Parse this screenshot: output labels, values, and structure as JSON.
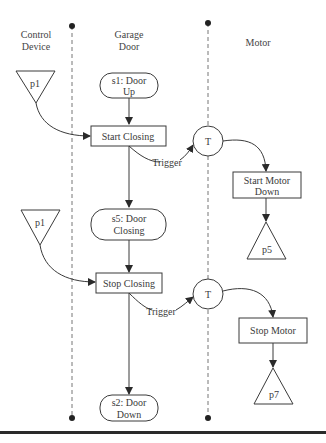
{
  "lanes": {
    "control_device": {
      "line1": "Control",
      "line2": "Device"
    },
    "garage_door": {
      "line1": "Garage",
      "line2": "Door"
    },
    "motor": {
      "label": "Motor"
    }
  },
  "places": {
    "p1_top": "p1",
    "p1_bottom": "p1",
    "p5": "p5",
    "p7": "p7"
  },
  "states": {
    "s1": {
      "line1": "s1: Door",
      "line2": "Up"
    },
    "s5": {
      "line1": "s5: Door",
      "line2": "Closing"
    },
    "s2": {
      "line1": "s2: Door",
      "line2": "Down"
    }
  },
  "actions": {
    "start_closing": "Start Closing",
    "stop_closing": "Stop Closing",
    "start_motor_down": {
      "line1": "Start Motor",
      "line2": "Down"
    },
    "stop_motor": "Stop Motor"
  },
  "transitions": {
    "t1": "T",
    "t2": "T"
  },
  "edges": {
    "trigger_1": "Trigger",
    "trigger_2": "Trigger"
  },
  "colors": {
    "stroke": "#3a3a3a",
    "lane": "#777777",
    "background": "#ffffff"
  }
}
